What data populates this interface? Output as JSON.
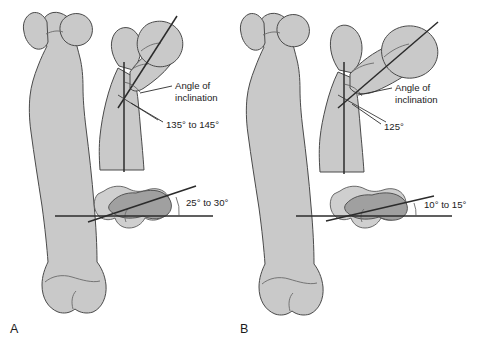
{
  "figure": {
    "background_color": "#ffffff",
    "bone_fill_color": "#c9c9c9",
    "bone_outline_color": "#4a4a4a",
    "overlap_fill_color": "#a0a0a0",
    "line_color": "#2b2b2b"
  },
  "panels": [
    {
      "letter": "A",
      "inclination": {
        "label_line1": "Angle of",
        "label_line2": "inclination",
        "value": "135° to 145°"
      },
      "torsion": {
        "value": "25° to 30°"
      }
    },
    {
      "letter": "B",
      "inclination": {
        "label_line1": "Angle of",
        "label_line2": "inclination",
        "value": "125°"
      },
      "torsion": {
        "value": "10° to 15°"
      }
    }
  ]
}
